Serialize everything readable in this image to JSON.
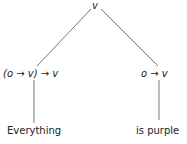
{
  "tree": {
    "root": {
      "label": "v"
    },
    "left": {
      "type_label": "(o → v) → v",
      "leaf": "Everything"
    },
    "right": {
      "type_label": "o → v",
      "leaf": "is purple"
    }
  },
  "colors": {
    "line": "#555555",
    "text": "#222222"
  }
}
